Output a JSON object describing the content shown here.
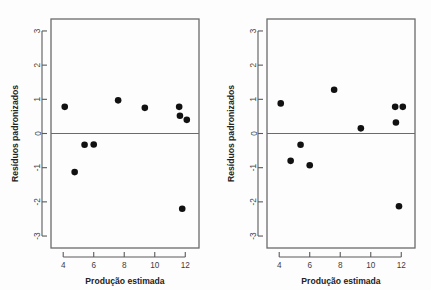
{
  "figure": {
    "panel_count": 2,
    "background_color": "#fdfdfd",
    "point_color": "#111111",
    "frame_color": "#6b6b6b"
  },
  "chart_data": [
    {
      "type": "scatter",
      "title": "",
      "xlabel": "Produção estimada",
      "ylabel": "Resíduos padronizados",
      "xlim": [
        3.2,
        12.9
      ],
      "ylim": [
        -3.35,
        3.35
      ],
      "xticks": [
        4,
        6,
        8,
        10,
        12
      ],
      "yticks": [
        3,
        2,
        1,
        0,
        -1,
        -2,
        -3
      ],
      "xticklabels": [
        "4",
        "6",
        "8",
        "10",
        "12"
      ],
      "yticklabels": [
        "3",
        "2",
        "1",
        "0",
        "-1",
        "-2",
        "-3"
      ],
      "grid": false,
      "legend": null,
      "reference_line": {
        "orientation": "horizontal",
        "y": 0
      },
      "x": [
        4.1,
        4.75,
        5.4,
        6.0,
        7.6,
        9.35,
        11.6,
        11.65,
        12.1,
        11.8
      ],
      "y": [
        0.78,
        -1.13,
        -0.33,
        -0.32,
        0.97,
        0.75,
        0.78,
        0.52,
        0.4,
        -2.2
      ]
    },
    {
      "type": "scatter",
      "title": "",
      "xlabel": "Produção estimada",
      "ylabel": "Resíduos padronizados",
      "xlim": [
        3.2,
        12.9
      ],
      "ylim": [
        -3.35,
        3.35
      ],
      "xticks": [
        4,
        6,
        8,
        10,
        12
      ],
      "yticks": [
        3,
        2,
        1,
        0,
        -1,
        -2,
        -3
      ],
      "xticklabels": [
        "4",
        "6",
        "8",
        "10",
        "12"
      ],
      "yticklabels": [
        "3",
        "2",
        "1",
        "0",
        "-1",
        "-2",
        "-3"
      ],
      "grid": false,
      "legend": null,
      "reference_line": {
        "orientation": "horizontal",
        "y": 0
      },
      "x": [
        4.1,
        4.75,
        5.4,
        6.0,
        7.6,
        9.35,
        11.6,
        11.65,
        12.1,
        11.85
      ],
      "y": [
        0.88,
        -0.8,
        -0.33,
        -0.93,
        1.28,
        0.15,
        0.78,
        0.32,
        0.78,
        -2.13
      ]
    }
  ]
}
